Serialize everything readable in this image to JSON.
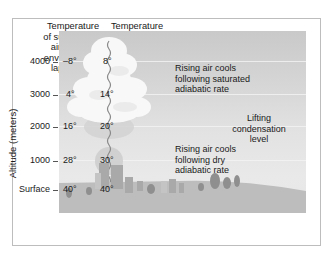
{
  "headers": {
    "surrounding": [
      "Temperature",
      "of surrounding",
      "air (follows",
      "environmental",
      "lapse rate)"
    ],
    "parcel": [
      "Temperature",
      "of rising",
      "parcel of",
      "air (follows",
      "DAR & SAR)"
    ]
  },
  "axis": {
    "title": "Altitude (meters)",
    "levels": [
      {
        "label": "4000",
        "surrounding": "–8°",
        "parcel": "8°"
      },
      {
        "label": "3000",
        "surrounding": "4°",
        "parcel": "14°"
      },
      {
        "label": "2000",
        "surrounding": "16°",
        "parcel": "20°"
      },
      {
        "label": "1000",
        "surrounding": "28°",
        "parcel": "30°"
      },
      {
        "label": "Surface",
        "surrounding": "40°",
        "parcel": "40°"
      }
    ]
  },
  "annotations": {
    "saturated": [
      "Rising air cools",
      "following saturated",
      "adiabatic rate"
    ],
    "lcl": [
      "Lifting",
      "condensation",
      "level"
    ],
    "dry": [
      "Rising air cools",
      "following dry",
      "adiabatic rate"
    ]
  },
  "colors": {
    "sky_top": "#c9c9c9",
    "sky_bottom": "#e9e9e9",
    "ground": "#bcbcbc",
    "cloud": "#f7f7f7",
    "parcel": "#cfcfcf",
    "text": "#1a1a1a"
  }
}
